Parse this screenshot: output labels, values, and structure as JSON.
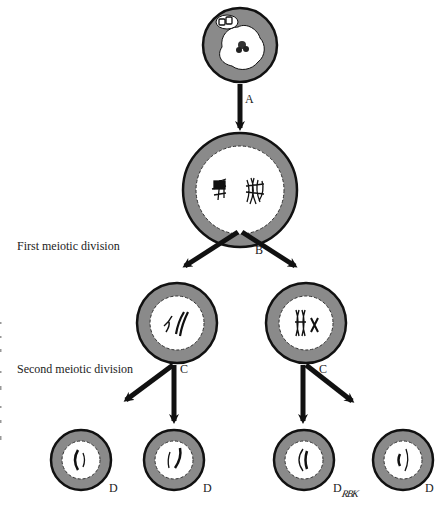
{
  "diagram": {
    "type": "meiosis",
    "stages": [
      {
        "id": "stage-first",
        "label": "First meiotic division"
      },
      {
        "id": "stage-second",
        "label": "Second meiotic division"
      }
    ],
    "step_labels": {
      "A": "A",
      "B": "B",
      "C_left": "C",
      "C_right": "C",
      "D1": "D",
      "D2": "D",
      "D3": "D",
      "D4": "D"
    },
    "signature": "RBK",
    "colors": {
      "ring": "#8a8a8a",
      "outline": "#111111",
      "nucleus": "#ffffff",
      "arrow": "#111111"
    },
    "cells": [
      {
        "id": "primary-cell",
        "cx": 240,
        "cy": 45,
        "r": 38
      },
      {
        "id": "meiosis-i-cell",
        "cx": 240,
        "cy": 190,
        "r": 58
      },
      {
        "id": "secondary-cell-left",
        "cx": 177,
        "cy": 323,
        "r": 41
      },
      {
        "id": "secondary-cell-right",
        "cx": 306,
        "cy": 323,
        "r": 41
      },
      {
        "id": "gamete-1",
        "cx": 81,
        "cy": 460,
        "r": 31
      },
      {
        "id": "gamete-2",
        "cx": 174,
        "cy": 460,
        "r": 31
      },
      {
        "id": "gamete-3",
        "cx": 304,
        "cy": 460,
        "r": 31
      },
      {
        "id": "gamete-4",
        "cx": 403,
        "cy": 460,
        "r": 31
      }
    ]
  }
}
